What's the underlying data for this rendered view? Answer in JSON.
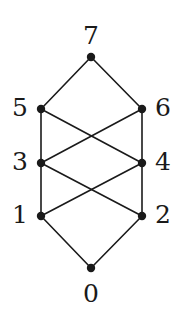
{
  "figure": {
    "kind": "hasse-diagram",
    "title": "",
    "width": 181,
    "height": 314,
    "background_color": "#ffffff",
    "ink_color": "#1a1a1a",
    "node_radius": 4.2,
    "edge_width": 1.6
  },
  "graph_data": {
    "type": "graph",
    "description": "Hasse diagram of a partially ordered set with 8 elements labelled 0 through 7",
    "nodes": [
      {
        "id": "0",
        "label": "0",
        "x": 91,
        "y": 268,
        "rank": 0,
        "label_x": 91,
        "label_y": 302,
        "label_anchor": "middle"
      },
      {
        "id": "1",
        "label": "1",
        "x": 41,
        "y": 216,
        "rank": 1,
        "label_x": 20,
        "label_y": 223,
        "label_anchor": "middle"
      },
      {
        "id": "2",
        "label": "2",
        "x": 142,
        "y": 216,
        "rank": 1,
        "label_x": 163,
        "label_y": 223,
        "label_anchor": "middle"
      },
      {
        "id": "3",
        "label": "3",
        "x": 41,
        "y": 163,
        "rank": 2,
        "label_x": 20,
        "label_y": 170,
        "label_anchor": "middle"
      },
      {
        "id": "4",
        "label": "4",
        "x": 142,
        "y": 163,
        "rank": 2,
        "label_x": 163,
        "label_y": 170,
        "label_anchor": "middle"
      },
      {
        "id": "5",
        "label": "5",
        "x": 41,
        "y": 109,
        "rank": 3,
        "label_x": 20,
        "label_y": 116,
        "label_anchor": "middle"
      },
      {
        "id": "6",
        "label": "6",
        "x": 142,
        "y": 109,
        "rank": 3,
        "label_x": 163,
        "label_y": 116,
        "label_anchor": "middle"
      },
      {
        "id": "7",
        "label": "7",
        "x": 91,
        "y": 57,
        "rank": 4,
        "label_x": 91,
        "label_y": 44,
        "label_anchor": "middle"
      }
    ],
    "edges": [
      {
        "from": "0",
        "to": "1"
      },
      {
        "from": "0",
        "to": "2"
      },
      {
        "from": "1",
        "to": "3"
      },
      {
        "from": "1",
        "to": "4"
      },
      {
        "from": "2",
        "to": "3"
      },
      {
        "from": "2",
        "to": "4"
      },
      {
        "from": "3",
        "to": "5"
      },
      {
        "from": "3",
        "to": "6"
      },
      {
        "from": "4",
        "to": "5"
      },
      {
        "from": "4",
        "to": "6"
      },
      {
        "from": "5",
        "to": "7"
      },
      {
        "from": "6",
        "to": "7"
      }
    ]
  }
}
